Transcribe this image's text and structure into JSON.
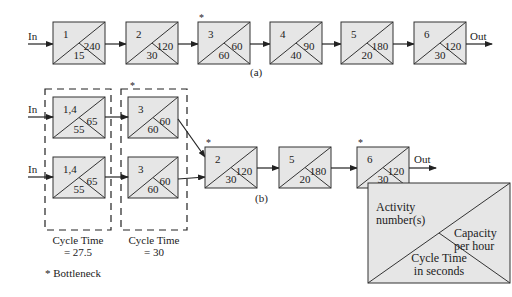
{
  "colors": {
    "box_fill": "#e6e6e6",
    "stroke": "#333333",
    "text": "#222222",
    "background": "#ffffff"
  },
  "diagram_a": {
    "caption": "(a)",
    "input_label": "In",
    "output_label": "Out",
    "stations": [
      {
        "activity": "1",
        "capacity": "240",
        "cycle_time": "15",
        "bottleneck": false
      },
      {
        "activity": "2",
        "capacity": "120",
        "cycle_time": "30",
        "bottleneck": false
      },
      {
        "activity": "3",
        "capacity": "60",
        "cycle_time": "60",
        "bottleneck": true
      },
      {
        "activity": "4",
        "capacity": "90",
        "cycle_time": "40",
        "bottleneck": false
      },
      {
        "activity": "5",
        "capacity": "180",
        "cycle_time": "20",
        "bottleneck": false
      },
      {
        "activity": "6",
        "capacity": "120",
        "cycle_time": "30",
        "bottleneck": false
      }
    ]
  },
  "diagram_b": {
    "caption": "(b)",
    "input_labels": [
      "In",
      "In"
    ],
    "output_label": "Out",
    "parallel_groups": [
      {
        "cycle_time_label": "Cycle Time",
        "cycle_time_value": "= 27.5",
        "bottleneck": false,
        "stations": [
          {
            "activity": "1,4",
            "capacity": "65",
            "cycle_time": "55"
          },
          {
            "activity": "1,4",
            "capacity": "65",
            "cycle_time": "55"
          }
        ]
      },
      {
        "cycle_time_label": "Cycle Time",
        "cycle_time_value": "= 30",
        "bottleneck": true,
        "stations": [
          {
            "activity": "3",
            "capacity": "60",
            "cycle_time": "60"
          },
          {
            "activity": "3",
            "capacity": "60",
            "cycle_time": "60"
          }
        ]
      }
    ],
    "serial_stations": [
      {
        "activity": "2",
        "capacity": "120",
        "cycle_time": "30",
        "bottleneck": true
      },
      {
        "activity": "5",
        "capacity": "180",
        "cycle_time": "20",
        "bottleneck": false
      },
      {
        "activity": "6",
        "capacity": "120",
        "cycle_time": "30",
        "bottleneck": true
      }
    ]
  },
  "bottleneck_note": "* Bottleneck",
  "bottleneck_marker": "*",
  "legend": {
    "activity_line1": "Activity",
    "activity_line2": "number(s)",
    "capacity_line1": "Capacity",
    "capacity_line2": "per hour",
    "cycle_line1": "Cycle Time",
    "cycle_line2": "in seconds"
  }
}
